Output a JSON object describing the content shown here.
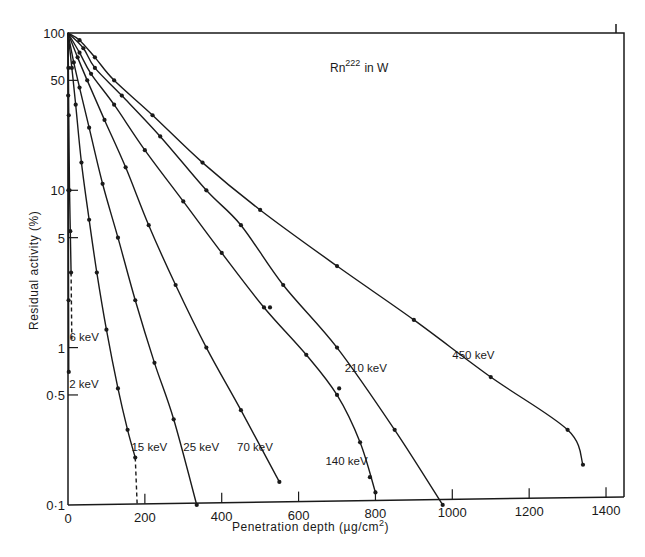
{
  "chart_data": {
    "type": "line",
    "title_parts": {
      "base": "Rn",
      "superscript": "222",
      "suffix": " in W"
    },
    "xlabel": "Penetration depth (µg/cm²)",
    "xlabel_parts": {
      "base": "Penetration depth  (µg/cm",
      "superscript": "2",
      "suffix": ")"
    },
    "ylabel": "Residual activity (%)",
    "xlim": [
      0,
      1450
    ],
    "ylim": [
      0.1,
      100
    ],
    "yscale": "log",
    "grid": false,
    "legend_position": "inline labels",
    "x_ticks": [
      0,
      200,
      400,
      600,
      800,
      1000,
      1200,
      1400
    ],
    "x_tick_labels": [
      "0",
      "200",
      "400",
      "600",
      "800",
      "1000",
      "1200",
      "1400"
    ],
    "y_ticks": [
      100,
      50,
      10,
      5,
      1,
      0.5,
      0.1
    ],
    "y_tick_labels": [
      "100",
      "50",
      "10",
      "5",
      "1",
      "0·5",
      "0·1"
    ],
    "series": [
      {
        "name": "2 keV",
        "label": "2 keV",
        "x": [
          0,
          0.5,
          1,
          1.5,
          2
        ],
        "y": [
          100,
          40,
          10,
          2,
          0.7
        ],
        "dashed_tail": null,
        "label_at": [
          3,
          0.55
        ]
      },
      {
        "name": "6 keV",
        "label": "6 keV",
        "x": [
          0,
          1,
          2,
          4,
          6,
          8
        ],
        "y": [
          100,
          60,
          30,
          10,
          5.5,
          3
        ],
        "dashed_tail": {
          "x": [
            8,
            10
          ],
          "y": [
            3,
            1.1
          ]
        },
        "label_at": [
          4,
          1.1
        ]
      },
      {
        "name": "15 keV",
        "label": "15 keV",
        "x": [
          0,
          10,
          20,
          35,
          55,
          75,
          100,
          130,
          155,
          175
        ],
        "y": [
          100,
          60,
          35,
          15,
          6.5,
          3.0,
          1.3,
          0.55,
          0.3,
          0.2
        ],
        "dashed_tail": {
          "x": [
            175,
            180
          ],
          "y": [
            0.2,
            0.1
          ]
        },
        "label_at": [
          165,
          0.22
        ]
      },
      {
        "name": "25 keV",
        "label": "25 keV",
        "x": [
          0,
          15,
          30,
          55,
          90,
          130,
          175,
          225,
          275,
          335
        ],
        "y": [
          100,
          65,
          45,
          25,
          11,
          5.0,
          2.0,
          0.8,
          0.35,
          0.1
        ],
        "dashed_tail": null,
        "label_at": [
          300,
          0.22
        ]
      },
      {
        "name": "70 keV",
        "label": "70 keV",
        "x": [
          0,
          25,
          50,
          95,
          150,
          210,
          280,
          360,
          450,
          550
        ],
        "y": [
          100,
          70,
          50,
          28,
          14,
          6.0,
          2.5,
          1.0,
          0.4,
          0.14
        ],
        "dashed_tail": null,
        "label_at": [
          440,
          0.22
        ]
      },
      {
        "name": "140 keV",
        "label": "140 keV",
        "x": [
          0,
          30,
          60,
          120,
          200,
          300,
          400,
          510,
          620,
          700,
          760,
          800
        ],
        "y": [
          100,
          75,
          55,
          35,
          18,
          8.5,
          4.0,
          1.8,
          0.9,
          0.5,
          0.25,
          0.12
        ],
        "dashed_tail": null,
        "outliers": {
          "x": [
            510,
            690,
            770
          ],
          "y": [
            1.8,
            0.55,
            0.15
          ]
        },
        "label_at": [
          670,
          0.18
        ]
      },
      {
        "name": "210 keV",
        "label": "210 keV",
        "x": [
          0,
          40,
          70,
          140,
          240,
          360,
          450,
          560,
          700,
          850,
          975
        ],
        "y": [
          100,
          80,
          60,
          40,
          22,
          10,
          6.0,
          2.5,
          1.0,
          0.3,
          0.1
        ],
        "dashed_tail": null,
        "label_at": [
          720,
          0.7
        ]
      },
      {
        "name": "450 keV",
        "label": "450 keV",
        "x": [
          0,
          30,
          70,
          120,
          220,
          350,
          500,
          700,
          900,
          1100,
          1300,
          1340
        ],
        "y": [
          100,
          90,
          70,
          50,
          30,
          15,
          7.5,
          3.3,
          1.5,
          0.65,
          0.3,
          0.18
        ],
        "dashed_tail": null,
        "label_at": [
          1000,
          0.85
        ]
      }
    ],
    "colors": {
      "ink": "#1a1a1a",
      "background": "#ffffff"
    }
  },
  "labels": {
    "title_base": "Rn",
    "title_sup": "222",
    "title_suffix": "in W",
    "xlabel_base": "Penetration depth  (µg/cm",
    "xlabel_sup": "2",
    "xlabel_suffix": ")",
    "ylabel": "Residual activity (%)"
  }
}
